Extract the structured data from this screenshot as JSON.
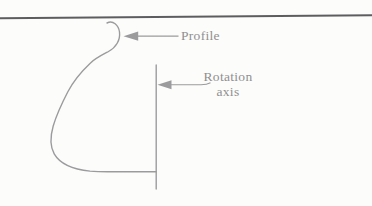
{
  "diagram": {
    "labels": {
      "profile": "Profile",
      "rotation_axis_line1": "Rotation",
      "rotation_axis_line2": "axis"
    },
    "colors": {
      "top_rule": "#5d5d60",
      "line": "#9b9b9d",
      "text": "#8f8f91",
      "background": "#fcfcfa"
    }
  }
}
